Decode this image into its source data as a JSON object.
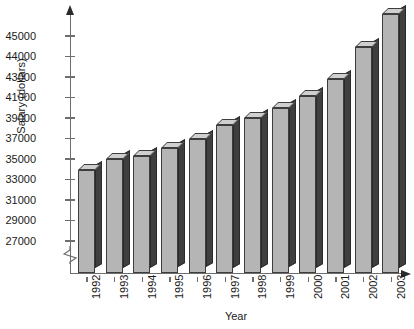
{
  "chart_data": {
    "type": "bar",
    "title": "",
    "xlabel": "Year",
    "ylabel": "Salary (dollars)",
    "categories": [
      "1992",
      "1993",
      "1994",
      "1995",
      "1996",
      "1997",
      "1998",
      "1999",
      "2000",
      "2001",
      "2002",
      "2003"
    ],
    "values": [
      33800,
      34900,
      35200,
      35900,
      36800,
      38200,
      38900,
      39800,
      41000,
      42700,
      44400,
      46000
    ],
    "series": [
      {
        "name": "Salary",
        "values": [
          33800,
          34900,
          35200,
          35900,
          36800,
          38200,
          38900,
          39800,
          41000,
          42700,
          44400,
          46000
        ]
      }
    ],
    "ytick_labels": [
      "27000",
      "29000",
      "31000",
      "33000",
      "35000",
      "37000",
      "39000",
      "41000",
      "43000",
      "44000",
      "45000"
    ],
    "ytick_values": [
      27000,
      29000,
      31000,
      33000,
      35000,
      37000,
      39000,
      41000,
      43000,
      44000,
      45000
    ],
    "ylim": [
      26200,
      46400
    ],
    "axis_break": true,
    "axis_break_note": "y-axis is broken below 27000",
    "grid": false,
    "legend": false,
    "legend_position": "none",
    "bar_style": "3d",
    "colors": {
      "bar_front": "#b5b5b5",
      "bar_side": "#3f3f3f",
      "bar_top": "#cfcfcf",
      "bar_outline": "#3d3d3d",
      "axis": "#6e6e6e",
      "text": "#1a1a1a",
      "background": "#ffffff"
    }
  },
  "axes": {
    "y_title": "Salary (dollars)",
    "x_title": "Year"
  }
}
